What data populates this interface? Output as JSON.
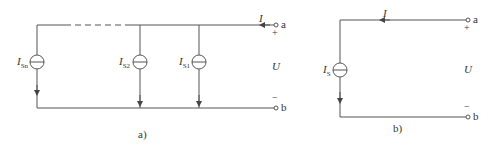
{
  "diagram_a": {
    "caption": "a)",
    "sources": [
      {
        "label": "I",
        "sub": "Sn"
      },
      {
        "label": "I",
        "sub": "S2"
      },
      {
        "label": "I",
        "sub": "S1"
      }
    ],
    "current_label": "I",
    "terminal_a": "a",
    "terminal_b": "b",
    "plus": "+",
    "minus": "−",
    "voltage": "U"
  },
  "diagram_b": {
    "caption": "b)",
    "source": {
      "label": "I",
      "sub": "S"
    },
    "current_label": "I",
    "terminal_a": "a",
    "terminal_b": "b",
    "plus": "+",
    "minus": "−",
    "voltage": "U"
  }
}
